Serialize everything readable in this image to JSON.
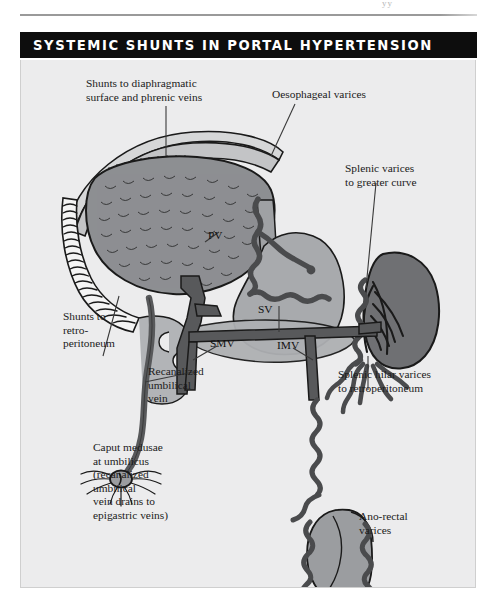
{
  "page": {
    "remnant_text": "yy",
    "title": "SYSTEMIC SHUNTS IN PORTAL HYPERTENSION"
  },
  "colors": {
    "title_bar_bg": "#0d0d0d",
    "title_text": "#ffffff",
    "panel_bg": "#ececed",
    "panel_border": "#cfcfcf",
    "organ_dark": "#808285",
    "organ_mid": "#9b9da0",
    "organ_light": "#b0b2b5",
    "vessel": "#58595b",
    "outline": "#1a1a1a",
    "leader_line": "#3a3a3a",
    "label_text": "#1b1b1b"
  },
  "figure": {
    "title": "Systemic shunts in portal hypertension",
    "labels": [
      {
        "id": "diaphragmatic-shunts",
        "text": "Shunts to diaphragmatic\nsurface and phrenic veins",
        "x": 85,
        "y": 77
      },
      {
        "id": "oesophageal-varices",
        "text": "Oesophageal varices",
        "x": 271,
        "y": 88
      },
      {
        "id": "splenic-varices-greater-curve",
        "text": "Splenic varices\nto greater curve",
        "x": 344,
        "y": 162
      },
      {
        "id": "shunts-retroperitoneum",
        "text": "Shunts to\nretro-\nperitoneum",
        "x": 62,
        "y": 310
      },
      {
        "id": "recanalized-umbilical-vein",
        "text": "Recanalized\numbilical\nvein",
        "x": 147,
        "y": 365
      },
      {
        "id": "caput-medusae",
        "text": "Caput medusae\nat umbilicus\n(recanalized\numbilical\nvein drains to\nepigastric veins)",
        "x": 92,
        "y": 441
      },
      {
        "id": "splenic-hilar-varices",
        "text": "Splenic hilar varices\nto retroperitoneum",
        "x": 337,
        "y": 368
      },
      {
        "id": "ano-rectal-varices",
        "text": "Ano-rectal\nvarices",
        "x": 358,
        "y": 510
      }
    ],
    "vessel_abbreviations": [
      {
        "id": "pv",
        "text": "PV",
        "x": 207,
        "y": 236,
        "full_name": "portal vein"
      },
      {
        "id": "sv",
        "text": "SV",
        "x": 257,
        "y": 310,
        "full_name": "splenic vein"
      },
      {
        "id": "smv",
        "text": "SMV",
        "x": 209,
        "y": 344,
        "full_name": "superior mesenteric vein"
      },
      {
        "id": "imv",
        "text": "IMV",
        "x": 276,
        "y": 346,
        "full_name": "inferior mesenteric vein"
      }
    ],
    "structures": [
      "liver",
      "diaphragm",
      "phrenic-shunt-veins",
      "bare-area-retroperitoneal-shunts",
      "stomach",
      "oesophagus",
      "oesophageal-varices-plexus",
      "spleen",
      "splenic-hilar-varices",
      "portal-vein",
      "splenic-vein",
      "superior-mesenteric-vein",
      "inferior-mesenteric-vein",
      "duodenum",
      "pancreas",
      "recanalized-umbilical-vein",
      "umbilicus-caput-medusae",
      "rectum",
      "ano-rectal-varices"
    ]
  }
}
